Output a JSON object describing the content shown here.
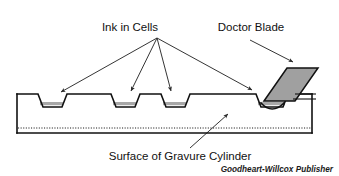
{
  "figure": {
    "background_color": "#ffffff"
  },
  "labels": {
    "ink_in_cells": "Ink in Cells",
    "doctor_blade": "Doctor Blade",
    "surface_of_gravure_cylinder": "Surface of Gravure Cylinder",
    "credit": "Goodheart-Willcox Publisher"
  },
  "colors": {
    "outline": "#111111",
    "ink_fill": "#a8a8a8",
    "blade_fill": "#a0a0a0",
    "leader_line": "#2a2a2a",
    "dotted_line": "#1b1b1b",
    "text": "#111111"
  },
  "geometry": {
    "cylinder_top_y": 94,
    "cylinder_bottom_y": 133,
    "dotted_line_y": 128,
    "cell_count": 4,
    "cell_depth": 13
  },
  "parts": [
    {
      "name": "ink-cell",
      "label": "Ink in Cells",
      "quantity": 4
    },
    {
      "name": "doctor-blade",
      "label": "Doctor Blade",
      "quantity": 1
    },
    {
      "name": "cylinder-surface",
      "label": "Surface of Gravure Cylinder",
      "quantity": 1
    }
  ]
}
